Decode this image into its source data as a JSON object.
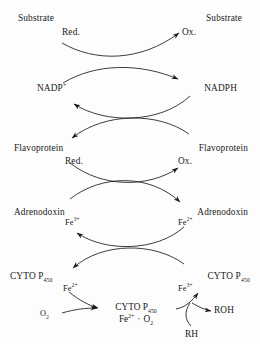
{
  "diagram": {
    "stroke_color": "#1a1a1a",
    "background_color": "#fdfdfd"
  },
  "labels": {
    "substrate_left": "Substrate",
    "substrate_left_state": "Red.",
    "substrate_right": "Substrate",
    "substrate_right_state": "Ox.",
    "nadp_plus": "NADP",
    "nadp_plus_charge": "+",
    "nadph": "NADPH",
    "flavoprotein_left": "Flavoprotein",
    "flavoprotein_left_state": "Red.",
    "flavoprotein_right": "Flavoprotein",
    "flavoprotein_right_state": "Ox.",
    "adrenodoxin_left": "Adrenodoxin",
    "adrenodoxin_left_iron": "Fe",
    "adrenodoxin_left_iron_charge": "3+",
    "adrenodoxin_right": "Adrenodoxin",
    "adrenodoxin_right_iron": "Fe",
    "adrenodoxin_right_iron_charge": "2+",
    "cyto_left": "CYTO P",
    "cyto_left_sub": "450",
    "cyto_left_iron": "Fe",
    "cyto_left_iron_charge": "2+",
    "cyto_right": "CYTO P",
    "cyto_right_sub": "450",
    "cyto_right_iron": "Fe",
    "cyto_right_iron_charge": "3+",
    "oxygen": "O",
    "oxygen_sub": "2",
    "complex_name": "CYTO P",
    "complex_name_sub": "450",
    "complex_iron": "Fe",
    "complex_iron_charge": "2+",
    "complex_dot": "·",
    "complex_oxygen": "O",
    "complex_oxygen_sub": "2",
    "substrate_rh": "RH",
    "product_roh": "ROH"
  }
}
